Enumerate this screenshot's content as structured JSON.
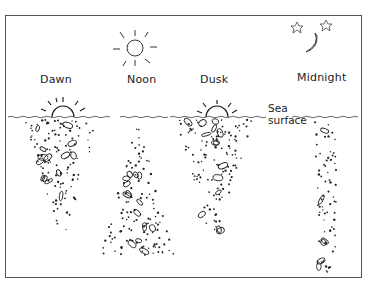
{
  "diagram": {
    "phases": [
      {
        "id": "dawn",
        "label": "Dawn",
        "sky": "rising-sun",
        "shape": "inverted-triangle",
        "depth": "shallow-to-mid"
      },
      {
        "id": "noon",
        "label": "Noon",
        "sky": "full-sun",
        "shape": "triangle",
        "depth": "deep"
      },
      {
        "id": "dusk",
        "label": "Dusk",
        "sky": "setting-sun",
        "shape": "inverted-triangle",
        "depth": "shallow-to-mid"
      },
      {
        "id": "midnight",
        "label": "Midnight",
        "sky": "moon-and-stars",
        "shape": "column",
        "depth": "dispersed"
      }
    ],
    "sea_surface_label_line1": "Sea",
    "sea_surface_label_line2": "surface",
    "colors": {
      "ink": "#222222",
      "frame": "#555555",
      "background": "#ffffff"
    }
  }
}
